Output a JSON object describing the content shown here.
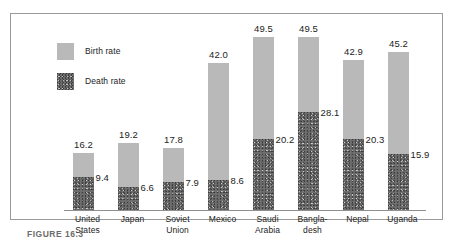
{
  "figure": {
    "caption": "FIGURE 16.3",
    "frame_border_color": "#9a9a9a",
    "background": "#ffffff"
  },
  "legend": {
    "position": "top-left-inside",
    "items": [
      {
        "label": "Birth rate",
        "swatch": "solid-light-gray-swatch",
        "color": "#b9b9b9"
      },
      {
        "label": "Death rate",
        "swatch": "stippled-dark-gray-swatch",
        "color": "#6e6e6e"
      }
    ]
  },
  "chart_data": {
    "type": "bar",
    "stacked": true,
    "title": "",
    "subtitle": "",
    "xlabel": "",
    "ylabel": "",
    "ylim": [
      0,
      52
    ],
    "grid": false,
    "legend_position": "top-left",
    "categories": [
      "United States",
      "Japan",
      "Soviet Union",
      "Mexico",
      "Saudi Arabia",
      "Bangladesh",
      "Nepal",
      "Uganda"
    ],
    "category_lines": [
      [
        "United",
        "States"
      ],
      [
        "Japan"
      ],
      [
        "Soviet",
        "Union"
      ],
      [
        "Mexico"
      ],
      [
        "Saudi",
        "Arabia"
      ],
      [
        "Bangla-",
        "desh"
      ],
      [
        "Nepal"
      ],
      [
        "Uganda"
      ]
    ],
    "series": [
      {
        "name": "Birth rate",
        "color": "#b9b9b9",
        "values": [
          16.2,
          19.2,
          17.8,
          42.0,
          49.5,
          49.5,
          42.9,
          45.2
        ],
        "note": "value shown is the total bar height (birth rate)"
      },
      {
        "name": "Death rate",
        "color": "#6e6e6e",
        "values": [
          9.4,
          6.6,
          7.9,
          8.6,
          20.2,
          28.1,
          20.3,
          15.9
        ],
        "note": "lower stacked segment"
      }
    ],
    "total_labels": [
      "16.2",
      "19.2",
      "17.8",
      "42.0",
      "49.5",
      "49.5",
      "42.9",
      "45.2"
    ],
    "death_labels": [
      "9.4",
      "6.6",
      "7.9",
      "8.6",
      "20.2",
      "28.1",
      "20.3",
      "15.9"
    ]
  }
}
